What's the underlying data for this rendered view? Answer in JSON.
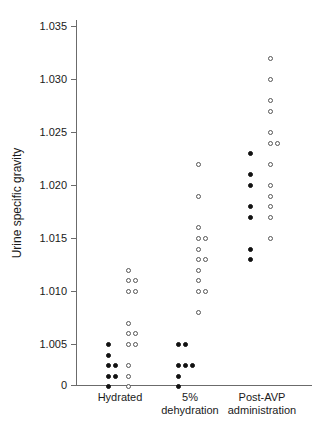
{
  "chart_data": {
    "type": "scatter",
    "title": "",
    "xlabel": "",
    "ylabel": "Urine specific gravity",
    "ylim": [
      1.0,
      1.035
    ],
    "y_ticks": [
      "0",
      "1.005",
      "1.010",
      "1.015",
      "1.020",
      "1.025",
      "1.030",
      "1.035"
    ],
    "y_tick_values": [
      1.0,
      1.005,
      1.01,
      1.015,
      1.02,
      1.025,
      1.03,
      1.035
    ],
    "axis_break_note": "y-axis baseline labelled 0 below 1.005",
    "grid": false,
    "legend": null,
    "categories": [
      "Hydrated",
      "5%\ndehydration",
      "Post-AVP\nadministration"
    ],
    "marker_styles": {
      "filled": "filled black circle",
      "open": "open circle"
    },
    "series": [
      {
        "name": "Hydrated",
        "category_index": 0,
        "filled": [
          1.005,
          1.004,
          1.003,
          1.003,
          1.002,
          1.002,
          1.001
        ],
        "open": [
          1.012,
          1.011,
          1.011,
          1.01,
          1.01,
          1.007,
          1.006,
          1.006,
          1.005,
          1.005,
          1.003,
          1.002,
          1.001
        ]
      },
      {
        "name": "5% dehydration",
        "category_index": 1,
        "filled": [
          1.005,
          1.005,
          1.003,
          1.003,
          1.003,
          1.002,
          1.001
        ],
        "open": [
          1.022,
          1.019,
          1.016,
          1.015,
          1.015,
          1.014,
          1.013,
          1.013,
          1.012,
          1.011,
          1.01,
          1.01,
          1.008
        ]
      },
      {
        "name": "Post-AVP administration",
        "category_index": 2,
        "filled": [
          1.023,
          1.021,
          1.02,
          1.018,
          1.017,
          1.014,
          1.013
        ],
        "open": [
          1.032,
          1.03,
          1.028,
          1.027,
          1.025,
          1.024,
          1.024,
          1.022,
          1.02,
          1.019,
          1.018,
          1.017,
          1.015
        ]
      }
    ]
  },
  "axis": {
    "y_title": "Urine specific gravity",
    "ticks": [
      {
        "label": "1.035",
        "value": 1.035
      },
      {
        "label": "1.030",
        "value": 1.03
      },
      {
        "label": "1.025",
        "value": 1.025
      },
      {
        "label": "1.020",
        "value": 1.02
      },
      {
        "label": "1.015",
        "value": 1.015
      },
      {
        "label": "1.010",
        "value": 1.01
      },
      {
        "label": "1.005",
        "value": 1.005
      },
      {
        "label": "0",
        "value": 1.0
      }
    ]
  },
  "x_categories": [
    {
      "line1": "Hydrated",
      "line2": ""
    },
    {
      "line1": "5%",
      "line2": "dehydration"
    },
    {
      "line1": "Post-AVP",
      "line2": "administration"
    }
  ]
}
